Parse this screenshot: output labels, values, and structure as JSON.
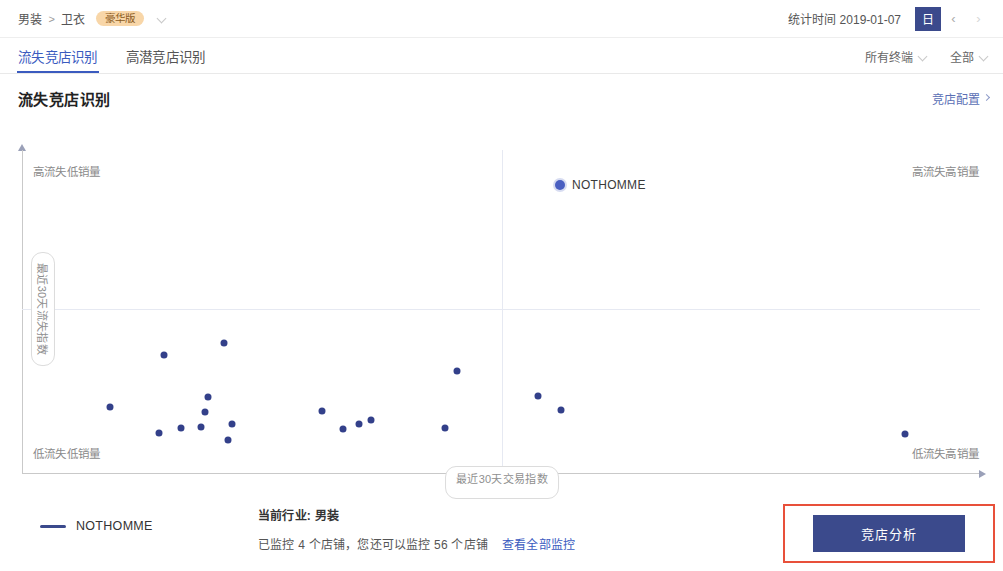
{
  "topbar": {
    "breadcrumb": {
      "root": "男装",
      "separator": ">",
      "current": "卫衣"
    },
    "badge": "豪华版",
    "stat_time_label": "统计时间 2019-01-07",
    "date_mode_button": "日",
    "prev_arrow": "‹",
    "next_arrow": "›"
  },
  "tabs": [
    {
      "label": "流失竞店识别",
      "active": true
    },
    {
      "label": "高潜竞店识别",
      "active": false
    }
  ],
  "filters": [
    {
      "label": "所有终端"
    },
    {
      "label": "全部"
    }
  ],
  "card": {
    "title": "流失竞店识别",
    "config_link": "竞店配置"
  },
  "chart_data": {
    "type": "scatter",
    "title": "流失竞店识别",
    "xlabel": "最近30天交易指数",
    "ylabel": "最近30天流失指数",
    "xlim": [
      0,
      100
    ],
    "ylim": [
      0,
      100
    ],
    "grid": false,
    "quadrant_labels": {
      "top_left": "高流失低销量",
      "top_right": "高流失高销量",
      "bottom_left": "低流失低销量",
      "bottom_right": "低流失高销量"
    },
    "quadrant_divider": {
      "x": 50,
      "y": 50
    },
    "legend": [
      {
        "name": "NOTHOMME",
        "color": "#3b4a8c"
      }
    ],
    "annotations": [
      {
        "label": "NOTHOMME",
        "x": 56.3,
        "y": 90.2,
        "color": "#4a5fc1",
        "highlight": true
      }
    ],
    "series": [
      {
        "name": "NOTHOMME",
        "color": "#33408a",
        "points": [
          {
            "x": 56.3,
            "y": 90.2,
            "highlight": true
          },
          {
            "x": 14.7,
            "y": 35.5
          },
          {
            "x": 21.0,
            "y": 39.3
          },
          {
            "x": 45.5,
            "y": 30.5
          },
          {
            "x": 9.0,
            "y": 19.0
          },
          {
            "x": 14.2,
            "y": 10.5
          },
          {
            "x": 16.5,
            "y": 12.2
          },
          {
            "x": 19.3,
            "y": 22.0
          },
          {
            "x": 19.0,
            "y": 17.3
          },
          {
            "x": 18.6,
            "y": 12.6
          },
          {
            "x": 21.8,
            "y": 13.5
          },
          {
            "x": 21.4,
            "y": 8.2
          },
          {
            "x": 31.3,
            "y": 17.5
          },
          {
            "x": 33.5,
            "y": 12.0
          },
          {
            "x": 35.2,
            "y": 13.6
          },
          {
            "x": 36.4,
            "y": 14.6
          },
          {
            "x": 44.2,
            "y": 12.1
          },
          {
            "x": 54.0,
            "y": 22.5
          },
          {
            "x": 56.4,
            "y": 18.0
          },
          {
            "x": 92.5,
            "y": 10.2
          }
        ]
      }
    ]
  },
  "footer": {
    "legend_label": "NOTHOMME",
    "industry_label": "当前行业: 男装",
    "monitor_text": "已监控 4 个店铺，您还可以监控 56 个店铺",
    "monitor_link": "查看全部监控",
    "primary_button": "竞店分析"
  },
  "colors": {
    "accent": "#3b5bbf",
    "brand_dark": "#3b4a8c",
    "dot": "#33408a",
    "badge_bg": "#f8d6a8",
    "highlight_box": "#e8503a"
  }
}
